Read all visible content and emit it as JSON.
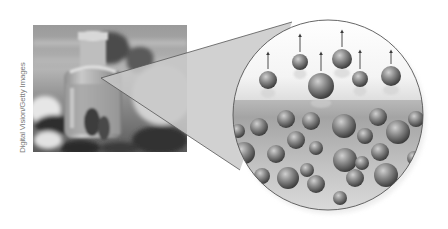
{
  "figure": {
    "photo_credit": "Digital Vision/Getty Images",
    "photo_subject": "perfume-bottle-photo",
    "magnified_view": "evaporation-molecules-diagram",
    "colors": {
      "background": "#ffffff",
      "cone_fill": "#c8c8c8",
      "outline": "#555555",
      "arrow": "#3a3a3a",
      "sphere_light": "#bdbdbd",
      "sphere_dark": "#3c3c3c",
      "liquid_top": "#a9a9a9",
      "liquid_bottom": "#d8d8d8"
    },
    "gas_molecules": [
      {
        "cx": 268,
        "cy": 80,
        "r": 9,
        "arrow_top": 52
      },
      {
        "cx": 300,
        "cy": 62,
        "r": 8,
        "arrow_top": 34
      },
      {
        "cx": 321,
        "cy": 86,
        "r": 13,
        "arrow_top": 52
      },
      {
        "cx": 342,
        "cy": 59,
        "r": 10,
        "arrow_top": 30
      },
      {
        "cx": 360,
        "cy": 79,
        "r": 8,
        "arrow_top": 50
      },
      {
        "cx": 391,
        "cy": 76,
        "r": 10,
        "arrow_top": 50
      }
    ],
    "liquid_molecules": [
      {
        "cx": 238,
        "cy": 131,
        "r": 7
      },
      {
        "cx": 259,
        "cy": 127,
        "r": 9
      },
      {
        "cx": 286,
        "cy": 119,
        "r": 9
      },
      {
        "cx": 311,
        "cy": 121,
        "r": 9
      },
      {
        "cx": 344,
        "cy": 126,
        "r": 12
      },
      {
        "cx": 378,
        "cy": 117,
        "r": 9
      },
      {
        "cx": 416,
        "cy": 119,
        "r": 8
      },
      {
        "cx": 296,
        "cy": 140,
        "r": 9
      },
      {
        "cx": 365,
        "cy": 136,
        "r": 8
      },
      {
        "cx": 398,
        "cy": 132,
        "r": 12
      },
      {
        "cx": 244,
        "cy": 153,
        "r": 11
      },
      {
        "cx": 276,
        "cy": 154,
        "r": 9
      },
      {
        "cx": 316,
        "cy": 148,
        "r": 7
      },
      {
        "cx": 345,
        "cy": 160,
        "r": 12
      },
      {
        "cx": 362,
        "cy": 163,
        "r": 7
      },
      {
        "cx": 380,
        "cy": 152,
        "r": 9
      },
      {
        "cx": 414,
        "cy": 158,
        "r": 7
      },
      {
        "cx": 262,
        "cy": 176,
        "r": 8
      },
      {
        "cx": 288,
        "cy": 178,
        "r": 11
      },
      {
        "cx": 316,
        "cy": 184,
        "r": 9
      },
      {
        "cx": 355,
        "cy": 178,
        "r": 9
      },
      {
        "cx": 386,
        "cy": 175,
        "r": 12
      },
      {
        "cx": 307,
        "cy": 170,
        "r": 7
      },
      {
        "cx": 340,
        "cy": 198,
        "r": 7
      },
      {
        "cx": 262,
        "cy": 200,
        "r": 6
      },
      {
        "cx": 400,
        "cy": 196,
        "r": 6
      }
    ]
  }
}
